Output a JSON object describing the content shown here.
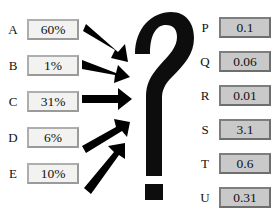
{
  "diagram": {
    "center_symbol": "?",
    "center_symbol_name": "question-mark",
    "arrow_count": 5,
    "colors": {
      "arrow": "#000000",
      "question_mark": "#0d0d0d",
      "input_box_fill": "#f2f2f0",
      "input_box_border": "#9a9a9a",
      "output_box_fill": "#c9c9c9",
      "output_box_border": "#6e6e6e",
      "text": "#111111",
      "background": "#ffffff"
    }
  },
  "inputs": [
    {
      "label": "A",
      "value": "60%"
    },
    {
      "label": "B",
      "value": "1%"
    },
    {
      "label": "C",
      "value": "31%"
    },
    {
      "label": "D",
      "value": "6%"
    },
    {
      "label": "E",
      "value": "10%"
    }
  ],
  "outputs": [
    {
      "label": "P",
      "value": "0.1"
    },
    {
      "label": "Q",
      "value": "0.06"
    },
    {
      "label": "R",
      "value": "0.01"
    },
    {
      "label": "S",
      "value": "3.1"
    },
    {
      "label": "T",
      "value": "0.6"
    },
    {
      "label": "U",
      "value": "0.31"
    }
  ]
}
